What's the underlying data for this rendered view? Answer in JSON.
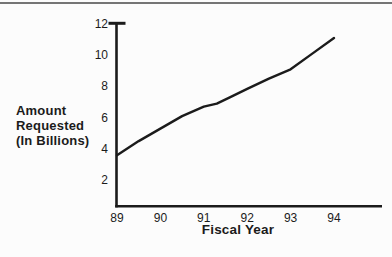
{
  "chart_data": {
    "type": "line",
    "title": "",
    "xlabel": "Fiscal Year",
    "ylabel": "Amount\nRequested\n(In Billions)",
    "categories": [
      "89",
      "90",
      "91",
      "92",
      "93",
      "94"
    ],
    "series": [
      {
        "name": "Amount Requested (In Billions)",
        "values": [
          3.6,
          5.3,
          6.7,
          7.9,
          9.1,
          11.1
        ]
      }
    ],
    "curve_points": [
      [
        89,
        3.6
      ],
      [
        89.5,
        4.5
      ],
      [
        90,
        5.3
      ],
      [
        90.5,
        6.1
      ],
      [
        91,
        6.7
      ],
      [
        91.3,
        6.9
      ],
      [
        91.6,
        7.3
      ],
      [
        92,
        7.85
      ],
      [
        92.5,
        8.5
      ],
      [
        93,
        9.1
      ],
      [
        93.5,
        10.1
      ],
      [
        94,
        11.1
      ]
    ],
    "yticks": [
      2,
      4,
      6,
      8,
      10,
      12
    ],
    "ylim": [
      0,
      12
    ],
    "xlim": [
      89,
      94
    ],
    "grid": false,
    "legend": "none",
    "line_color": "#1b1b1b",
    "axis_color": "#1b1b1b"
  },
  "page": {
    "background": "#fcfcfc",
    "top_rule_color": "#757575"
  }
}
